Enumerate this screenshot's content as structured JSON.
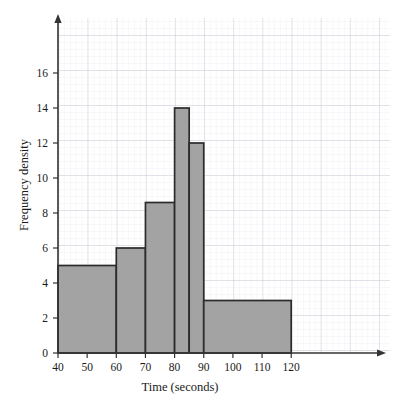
{
  "chart_data": {
    "type": "bar",
    "title": "",
    "subtitle": "",
    "xlabel": "Time (seconds)",
    "ylabel": "Frequency density",
    "xlim": [
      40,
      125
    ],
    "ylim": [
      0,
      17.5
    ],
    "grid": true,
    "legend": null,
    "x_ticks": [
      40,
      50,
      60,
      70,
      80,
      90,
      100,
      110,
      120
    ],
    "x_tick_labels": [
      "40",
      "50",
      "60",
      "70",
      "80",
      "90",
      "100",
      "110",
      "120"
    ],
    "y_ticks": [
      0,
      2,
      4,
      6,
      8,
      10,
      12,
      14,
      16
    ],
    "y_tick_labels": [
      "0",
      "2",
      "4",
      "6",
      "8",
      "10",
      "12",
      "14",
      "16"
    ],
    "bins": [
      {
        "label": "40-60",
        "x_start": 40,
        "x_end": 60,
        "value": 5
      },
      {
        "label": "60-70",
        "x_start": 60,
        "x_end": 70,
        "value": 6
      },
      {
        "label": "70-80",
        "x_start": 70,
        "x_end": 80,
        "value": 8.6
      },
      {
        "label": "80-85",
        "x_start": 80,
        "x_end": 85,
        "value": 14
      },
      {
        "label": "85-90",
        "x_start": 85,
        "x_end": 90,
        "value": 12
      },
      {
        "label": "90-120",
        "x_start": 90,
        "x_end": 120,
        "value": 3
      }
    ],
    "categories": [
      "40-60",
      "60-70",
      "70-80",
      "80-85",
      "85-90",
      "90-120"
    ],
    "values": [
      5,
      6,
      8.6,
      14,
      12,
      3
    ],
    "colors": {
      "bar_fill": "#a3a3a3",
      "bar_stroke": "#2b2b2b",
      "axis": "#333333",
      "grid_minor": "#e3e3ea",
      "grid_major": "#c9c9d4",
      "text": "#1a1a1a"
    }
  }
}
